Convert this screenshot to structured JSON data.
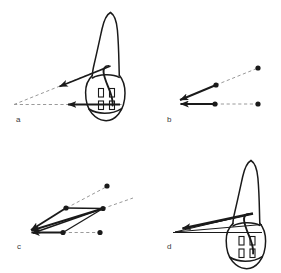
{
  "figure": {
    "type": "scientific-line-diagram",
    "background_color": "#ffffff",
    "ink_color": "#1a1a1a",
    "dash_color": "#9a9a9a",
    "panels": [
      {
        "id": "a",
        "label": "a",
        "label_pos": {
          "x": 16,
          "y": 120
        },
        "has_tooth": true,
        "description": "tooth with single oblique force arrow and horizontal force arrow converging at a distant point"
      },
      {
        "id": "b",
        "label": "b",
        "label_pos": {
          "x": 167,
          "y": 120
        },
        "has_tooth": false,
        "description": "two vectors with dashed line-of-action extensions and endpoint dots"
      },
      {
        "id": "c",
        "label": "c",
        "label_pos": {
          "x": 17,
          "y": 246
        },
        "has_tooth": false,
        "description": "parallelogram resultant construction of three converging vectors"
      },
      {
        "id": "d",
        "label": "d",
        "label_pos": {
          "x": 167,
          "y": 246
        },
        "has_tooth": true,
        "description": "tooth with triangle of construction lines and bold resultant arrow"
      }
    ],
    "tooth_features": {
      "root": "tapered curved root apex",
      "crown": "rounded crown outline with incisal edge notches",
      "canal": "curved pulp canal outline",
      "slots": 4,
      "slot_layout": "2x2 grid of small rectangles on crown face"
    }
  }
}
